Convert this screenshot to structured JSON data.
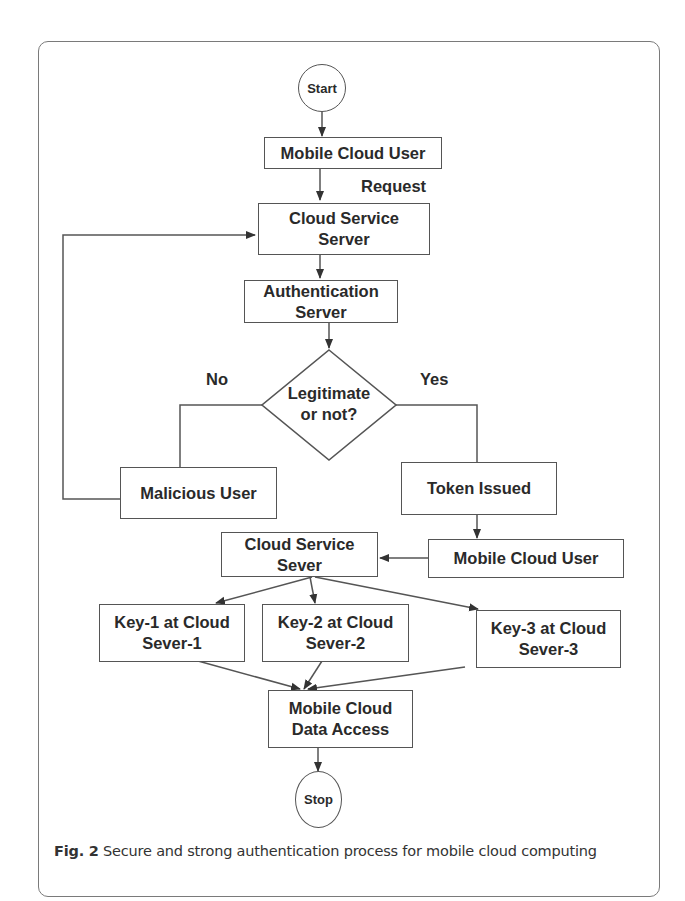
{
  "figure": {
    "caption_label": "Fig. 2",
    "caption_text": " Secure and strong authentication process for mobile cloud computing"
  },
  "nodes": {
    "start": "Start",
    "mobile_cloud_user_1": "Mobile Cloud User",
    "cloud_service_server_1": "Cloud Service\nServer",
    "authentication_server": "Authentication\nServer",
    "decision": "Legitimate\nor not?",
    "malicious_user": "Malicious User",
    "token_issued": "Token Issued",
    "mobile_cloud_user_2": "Mobile Cloud User",
    "cloud_service_server_2": "Cloud Service\nSever",
    "key1": "Key-1 at Cloud\nSever-1",
    "key2": "Key-2 at Cloud\nSever-2",
    "key3": "Key-3 at Cloud\nSever-3",
    "data_access": "Mobile Cloud\nData Access",
    "stop": "Stop"
  },
  "edge_labels": {
    "request": "Request",
    "no": "No",
    "yes": "Yes"
  }
}
